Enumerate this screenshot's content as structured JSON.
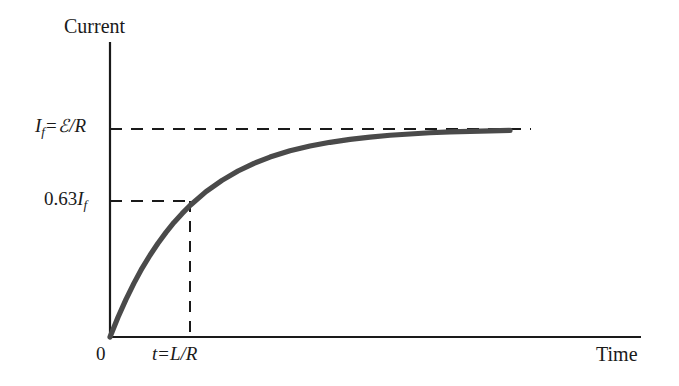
{
  "figure": {
    "background_color": "#ffffff",
    "axis_color": "#1a1a1a",
    "curve_color": "#4a4a4a",
    "dash_color": "#1a1a1a"
  },
  "axes": {
    "y_title": "Current",
    "x_title": "Time",
    "origin_label": "0"
  },
  "annotations": {
    "final_current": {
      "symbol_i": "I",
      "symbol_i_sub": "f",
      "equals": "=",
      "emf_symbol": "ℰ",
      "slash": "/",
      "resistance": "R",
      "full_text": "I_f = ℰ/R"
    },
    "tau_current": {
      "coefficient": "0.63",
      "symbol_i": "I",
      "symbol_i_sub": "f",
      "full_text": "0.63I_f"
    },
    "tau_tick": {
      "symbol_t": "t",
      "equals": "=",
      "inductance": "L",
      "slash": "/",
      "resistance": "R",
      "full_text": "t = L/R"
    }
  },
  "chart_data": {
    "type": "line",
    "title": "",
    "xlabel": "Time",
    "ylabel": "Current",
    "grid": false,
    "legend": null,
    "xlim": [
      0,
      5
    ],
    "ylim": [
      0,
      1.12
    ],
    "x_tick_labels": [
      "0",
      "t = L/R"
    ],
    "x_tick_values": [
      0,
      1
    ],
    "y_tick_labels": [
      "0.63I_f",
      "I_f = ℰ/R"
    ],
    "y_tick_values": [
      0.632,
      1.0
    ],
    "series": [
      {
        "name": "I(t) = I_f (1 - e^(-t/τ)),  τ = L/R",
        "x": [
          0.0,
          0.1,
          0.2,
          0.3,
          0.4,
          0.5,
          0.6,
          0.7,
          0.8,
          0.9,
          1.0,
          1.2,
          1.4,
          1.6,
          1.8,
          2.0,
          2.25,
          2.5,
          2.75,
          3.0,
          3.25,
          3.5,
          3.75,
          4.0,
          4.25,
          4.5,
          4.75,
          5.0
        ],
        "values": [
          0.0,
          0.095,
          0.181,
          0.259,
          0.33,
          0.393,
          0.451,
          0.503,
          0.551,
          0.593,
          0.632,
          0.699,
          0.753,
          0.798,
          0.835,
          0.865,
          0.895,
          0.918,
          0.936,
          0.95,
          0.961,
          0.97,
          0.976,
          0.982,
          0.986,
          0.989,
          0.991,
          0.993
        ]
      }
    ],
    "reference_lines": [
      {
        "orientation": "horizontal",
        "value": 1.0,
        "style": "dashed",
        "label": "I_f = ℰ/R"
      },
      {
        "orientation": "horizontal",
        "value": 0.632,
        "style": "dashed",
        "label": "0.63I_f"
      },
      {
        "orientation": "vertical",
        "value": 1.0,
        "style": "dashed",
        "label": "t = L/R"
      }
    ]
  }
}
